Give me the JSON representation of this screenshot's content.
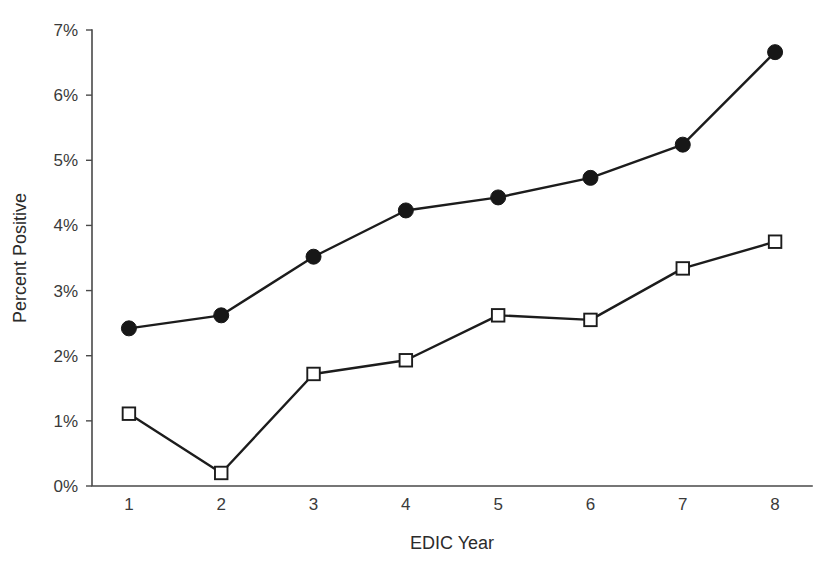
{
  "chart_data": {
    "type": "line",
    "title": "",
    "xlabel": "EDIC Year",
    "ylabel": "Percent Positive",
    "x": [
      1,
      2,
      3,
      4,
      5,
      6,
      7,
      8
    ],
    "categories": [
      "1",
      "2",
      "3",
      "4",
      "5",
      "6",
      "7",
      "8"
    ],
    "xtick_labels": [
      "1",
      "2",
      "3",
      "4",
      "5",
      "6",
      "7",
      "8"
    ],
    "ytick_labels": [
      "0%",
      "1%",
      "2%",
      "3%",
      "4%",
      "5%",
      "6%",
      "7%"
    ],
    "ytick_values": [
      0,
      1,
      2,
      3,
      4,
      5,
      6,
      7
    ],
    "xlim": [
      0.6,
      8.4
    ],
    "ylim": [
      0,
      7
    ],
    "grid": false,
    "legend": false,
    "legend_position": "none",
    "yunit": "%",
    "series": [
      {
        "name": "Filled circle series",
        "marker": "filled-circle",
        "marker_color": "#171717",
        "line_color": "#1c1c1c",
        "values": [
          2.42,
          2.62,
          3.52,
          4.23,
          4.43,
          4.73,
          5.24,
          6.66
        ]
      },
      {
        "name": "Open square series",
        "marker": "open-square",
        "marker_color": "#ffffff",
        "marker_edge_color": "#1c1c1c",
        "line_color": "#1c1c1c",
        "values": [
          1.11,
          0.2,
          1.72,
          1.93,
          2.62,
          2.55,
          3.34,
          3.75
        ]
      }
    ]
  },
  "colors": {
    "background": "#ffffff",
    "axis": "#4a4a4a",
    "line": "#1c1c1c",
    "text": "#2b2b2b"
  }
}
